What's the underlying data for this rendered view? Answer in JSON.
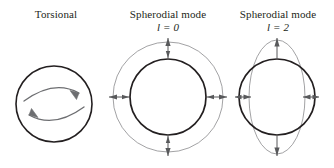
{
  "figure": {
    "background_color": "#ffffff",
    "width": 334,
    "height": 168,
    "panels": [
      {
        "id": "torsional",
        "caption_line1": "Torsional",
        "caption_line2": "",
        "mode_symbol": "",
        "mode_value": "",
        "shapes": {
          "circle": {
            "cx": 54,
            "cy": 104,
            "r": 38,
            "stroke": "#231f20",
            "stroke_width": 1.6
          },
          "arrows": [
            {
              "name": "rotation-arrow-top",
              "direction": "clockwise",
              "stroke": "#6d6e71"
            },
            {
              "name": "rotation-arrow-bottom",
              "direction": "clockwise",
              "stroke": "#6d6e71"
            }
          ]
        }
      },
      {
        "id": "spheroidal-l0",
        "caption_line1": "Spherodial mode",
        "caption_line2": "l = 0",
        "mode_symbol": "l",
        "mode_value": "0",
        "shapes": {
          "inner_circle": {
            "cx": 58,
            "cy": 97,
            "r": 38,
            "stroke": "#231f20",
            "stroke_width": 1.7
          },
          "outer_circle": {
            "cx": 58,
            "cy": 97,
            "r": 55,
            "stroke": "#8a8a8d",
            "stroke_width": 0.8
          },
          "arrows": [
            {
              "name": "radial-arrow-up",
              "angle_deg": 270,
              "double_headed": true,
              "stroke": "#58595b"
            },
            {
              "name": "radial-arrow-down",
              "angle_deg": 90,
              "double_headed": true,
              "stroke": "#58595b"
            },
            {
              "name": "radial-arrow-left",
              "angle_deg": 180,
              "double_headed": true,
              "stroke": "#58595b"
            },
            {
              "name": "radial-arrow-right",
              "angle_deg": 0,
              "double_headed": true,
              "stroke": "#58595b"
            }
          ]
        }
      },
      {
        "id": "spheroidal-l2",
        "caption_line1": "Spherodial mode",
        "caption_line2": "l = 2",
        "mode_symbol": "l",
        "mode_value": "2",
        "shapes": {
          "circle": {
            "cx": 55,
            "cy": 97,
            "r": 38,
            "stroke": "#231f20",
            "stroke_width": 1.7
          },
          "ellipse": {
            "cx": 55,
            "cy": 97,
            "rx": 28,
            "ry": 57,
            "stroke": "#8a8a8d",
            "stroke_width": 0.8
          },
          "arrows": [
            {
              "name": "polar-arrow-up",
              "direction": "outward-up",
              "double_headed": false,
              "stroke": "#58595b"
            },
            {
              "name": "polar-arrow-down",
              "direction": "outward-down",
              "double_headed": false,
              "stroke": "#58595b"
            },
            {
              "name": "equatorial-arrow-left",
              "direction": "inward",
              "double_headed": true,
              "stroke": "#58595b"
            },
            {
              "name": "equatorial-arrow-right",
              "direction": "inward",
              "double_headed": true,
              "stroke": "#58595b"
            }
          ]
        }
      }
    ]
  },
  "colors": {
    "dark_stroke": "#231f20",
    "light_stroke": "#8a8a8d",
    "arrow_stroke": "#58595b",
    "rotation_arrow_stroke": "#6d6e71",
    "background": "#ffffff"
  }
}
